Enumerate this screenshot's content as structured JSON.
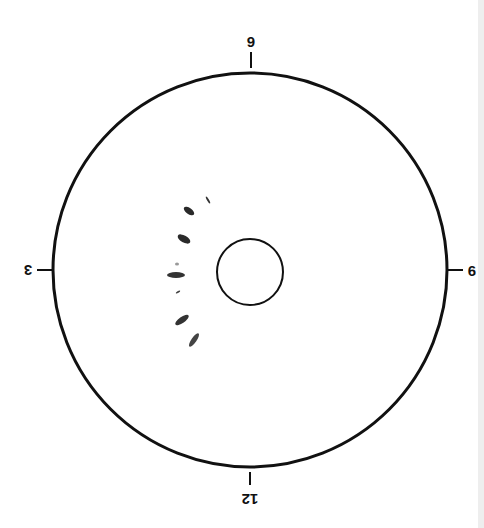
{
  "diagram": {
    "type": "clock-face target / pattern diagram (inverted orientation)",
    "outer_circle": {
      "cx": 250,
      "cy": 270,
      "r": 197,
      "stroke": "#111111",
      "stroke_width": 3
    },
    "inner_circle": {
      "cx": 250,
      "cy": 272,
      "r": 33,
      "stroke": "#111111",
      "stroke_width": 2
    },
    "labels": {
      "top": "9",
      "left": "3",
      "right": "6",
      "bottom": "12"
    },
    "marks": [
      {
        "cx": 208,
        "cy": 200,
        "rx": 4,
        "ry": 1,
        "angle": 60,
        "fill": "#333333"
      },
      {
        "cx": 189,
        "cy": 211,
        "rx": 6,
        "ry": 3,
        "angle": 35,
        "fill": "#2a2a2a"
      },
      {
        "cx": 184,
        "cy": 239,
        "rx": 7,
        "ry": 3.5,
        "angle": 30,
        "fill": "#2a2a2a"
      },
      {
        "cx": 177,
        "cy": 264,
        "rx": 2,
        "ry": 1.5,
        "angle": 0,
        "fill": "#999999"
      },
      {
        "cx": 176,
        "cy": 275,
        "rx": 9,
        "ry": 3,
        "angle": 0,
        "fill": "#333333"
      },
      {
        "cx": 178,
        "cy": 292,
        "rx": 2.5,
        "ry": 1,
        "angle": -30,
        "fill": "#444444"
      },
      {
        "cx": 182,
        "cy": 320,
        "rx": 8,
        "ry": 3,
        "angle": -35,
        "fill": "#333333"
      },
      {
        "cx": 194,
        "cy": 340,
        "rx": 8,
        "ry": 2.5,
        "angle": -55,
        "fill": "#444444"
      }
    ],
    "colors": {
      "line": "#111111",
      "background": "#ffffff",
      "edge_strip": "#eeeeee"
    }
  }
}
